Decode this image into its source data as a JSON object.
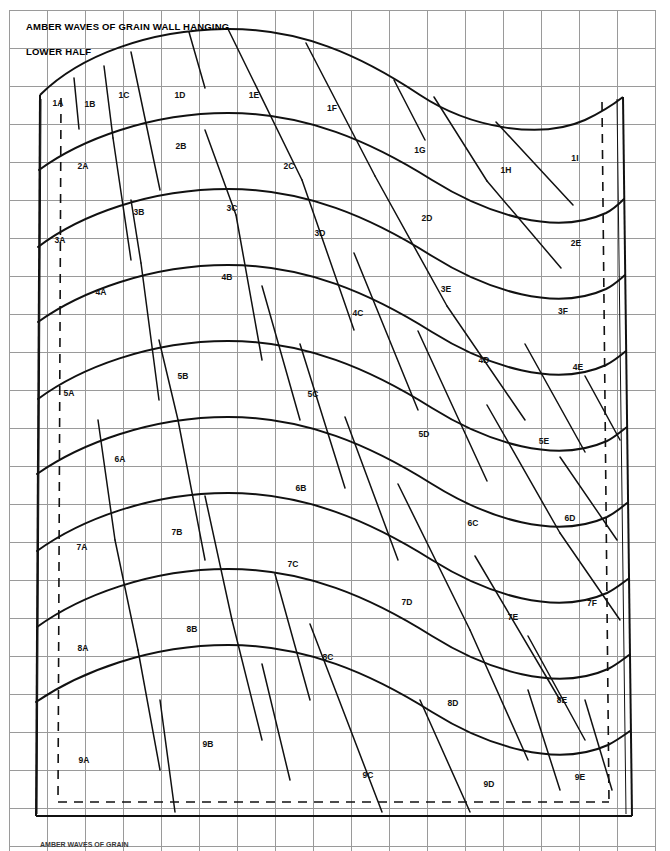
{
  "document": {
    "title_line_1": "AMBER WAVES OF GRAIN WALL HANGING",
    "title_line_2": "LOWER HALF",
    "footnote": "AMBER WAVES OF GRAIN",
    "colors": {
      "grid": "#9a9a9a",
      "ink": "#111111",
      "paper": "#ffffff"
    },
    "grid": {
      "cell_size": 38,
      "origin_x": 9,
      "origin_y": 10,
      "columns": 18,
      "rows": 22
    }
  },
  "pattern_pieces": [
    {
      "id": "1A",
      "x": 58,
      "y": 103
    },
    {
      "id": "1B",
      "x": 90,
      "y": 104
    },
    {
      "id": "1C",
      "x": 124,
      "y": 95
    },
    {
      "id": "1D",
      "x": 180,
      "y": 95
    },
    {
      "id": "1E",
      "x": 254,
      "y": 95
    },
    {
      "id": "1F",
      "x": 332,
      "y": 108
    },
    {
      "id": "1G",
      "x": 420,
      "y": 150
    },
    {
      "id": "1H",
      "x": 506,
      "y": 170
    },
    {
      "id": "1I",
      "x": 575,
      "y": 158
    },
    {
      "id": "2A",
      "x": 83,
      "y": 166
    },
    {
      "id": "2B",
      "x": 181,
      "y": 146
    },
    {
      "id": "2C",
      "x": 289,
      "y": 166
    },
    {
      "id": "2D",
      "x": 427,
      "y": 218
    },
    {
      "id": "2E",
      "x": 576,
      "y": 243
    },
    {
      "id": "3A",
      "x": 60,
      "y": 240
    },
    {
      "id": "3B",
      "x": 139,
      "y": 212
    },
    {
      "id": "3C",
      "x": 232,
      "y": 208
    },
    {
      "id": "3D",
      "x": 320,
      "y": 233
    },
    {
      "id": "3E",
      "x": 446,
      "y": 289
    },
    {
      "id": "3F",
      "x": 563,
      "y": 311
    },
    {
      "id": "4A",
      "x": 101,
      "y": 292
    },
    {
      "id": "4B",
      "x": 227,
      "y": 277
    },
    {
      "id": "4C",
      "x": 358,
      "y": 313
    },
    {
      "id": "4D",
      "x": 484,
      "y": 360
    },
    {
      "id": "4E",
      "x": 578,
      "y": 367
    },
    {
      "id": "5A",
      "x": 69,
      "y": 393
    },
    {
      "id": "5B",
      "x": 183,
      "y": 376
    },
    {
      "id": "5C",
      "x": 313,
      "y": 394
    },
    {
      "id": "5D",
      "x": 424,
      "y": 434
    },
    {
      "id": "5E",
      "x": 544,
      "y": 441
    },
    {
      "id": "6A",
      "x": 120,
      "y": 459
    },
    {
      "id": "6B",
      "x": 301,
      "y": 488
    },
    {
      "id": "6C",
      "x": 473,
      "y": 523
    },
    {
      "id": "6D",
      "x": 570,
      "y": 518
    },
    {
      "id": "7A",
      "x": 82,
      "y": 547
    },
    {
      "id": "7B",
      "x": 177,
      "y": 532
    },
    {
      "id": "7C",
      "x": 293,
      "y": 564
    },
    {
      "id": "7D",
      "x": 407,
      "y": 602
    },
    {
      "id": "7E",
      "x": 513,
      "y": 617
    },
    {
      "id": "7F",
      "x": 592,
      "y": 603
    },
    {
      "id": "8A",
      "x": 83,
      "y": 648
    },
    {
      "id": "8B",
      "x": 192,
      "y": 629
    },
    {
      "id": "8C",
      "x": 328,
      "y": 657
    },
    {
      "id": "8D",
      "x": 453,
      "y": 703
    },
    {
      "id": "8E",
      "x": 562,
      "y": 700
    },
    {
      "id": "9A",
      "x": 84,
      "y": 760
    },
    {
      "id": "9B",
      "x": 208,
      "y": 744
    },
    {
      "id": "9C",
      "x": 368,
      "y": 775
    },
    {
      "id": "9D",
      "x": 489,
      "y": 784
    },
    {
      "id": "9E",
      "x": 580,
      "y": 777
    }
  ]
}
